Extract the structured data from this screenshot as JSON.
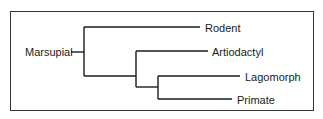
{
  "diagram": {
    "type": "cladogram",
    "root": "Marsupial",
    "leaves": [
      "Rodent",
      "Artiodactyl",
      "Lagomorph",
      "Primate"
    ],
    "tree": {
      "label": "Marsupial",
      "children": [
        {
          "label": "Rodent"
        },
        {
          "children": [
            {
              "label": "Artiodactyl"
            },
            {
              "children": [
                {
                  "label": "Lagomorph"
                },
                {
                  "label": "Primate"
                }
              ]
            }
          ]
        }
      ]
    }
  },
  "labels": {
    "root": "Marsupial",
    "rodent": "Rodent",
    "artiodactyl": "Artiodactyl",
    "lagomorph": "Lagomorph",
    "primate": "Primate"
  }
}
